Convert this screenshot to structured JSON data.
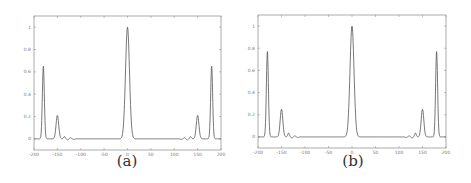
{
  "chart_data": [
    {
      "type": "line",
      "caption": "(a)",
      "xlim": [
        -200,
        200
      ],
      "ylim": [
        -0.1,
        1.1
      ],
      "xticks": [
        -200,
        -150,
        -100,
        -50,
        0,
        50,
        100,
        150,
        200
      ],
      "yticks": [
        0,
        0.2,
        0.4,
        0.6,
        0.8,
        1
      ],
      "grid": false,
      "peaks": [
        {
          "x": -180,
          "y": 0.65,
          "width": 3
        },
        {
          "x": -150,
          "y": 0.21,
          "width": 4
        },
        {
          "x": 0,
          "y": 1.0,
          "width": 6
        },
        {
          "x": 150,
          "y": 0.21,
          "width": 4
        },
        {
          "x": 180,
          "y": 0.65,
          "width": 3
        }
      ],
      "ripples": [
        {
          "x": -135,
          "y": 0.02
        },
        {
          "x": -128,
          "y": -0.01
        },
        {
          "x": -122,
          "y": 0.01
        },
        {
          "x": -115,
          "y": -0.005
        },
        {
          "x": 115,
          "y": -0.005
        },
        {
          "x": 122,
          "y": 0.01
        },
        {
          "x": 128,
          "y": -0.01
        },
        {
          "x": 135,
          "y": 0.02
        }
      ]
    },
    {
      "type": "line",
      "caption": "(b)",
      "xlim": [
        -200,
        200
      ],
      "ylim": [
        -0.1,
        1.1
      ],
      "xticks": [
        -200,
        -150,
        -100,
        -50,
        0,
        50,
        100,
        150,
        200
      ],
      "yticks": [
        0,
        0.2,
        0.4,
        0.6,
        0.8,
        1
      ],
      "grid": false,
      "peaks": [
        {
          "x": -180,
          "y": 0.77,
          "width": 3
        },
        {
          "x": -150,
          "y": 0.25,
          "width": 4
        },
        {
          "x": 0,
          "y": 1.0,
          "width": 6
        },
        {
          "x": 150,
          "y": 0.25,
          "width": 4
        },
        {
          "x": 180,
          "y": 0.77,
          "width": 3
        }
      ],
      "ripples": [
        {
          "x": -135,
          "y": 0.035
        },
        {
          "x": -128,
          "y": -0.01
        },
        {
          "x": -122,
          "y": 0.01
        },
        {
          "x": -115,
          "y": -0.005
        },
        {
          "x": 115,
          "y": -0.005
        },
        {
          "x": 122,
          "y": 0.01
        },
        {
          "x": 128,
          "y": -0.01
        },
        {
          "x": 135,
          "y": 0.035
        }
      ]
    }
  ]
}
